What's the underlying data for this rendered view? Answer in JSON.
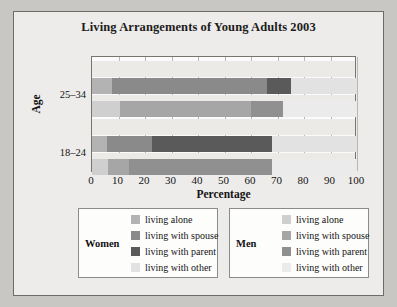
{
  "chart_data": {
    "type": "bar",
    "orientation": "horizontal",
    "stacked": true,
    "title": "Living Arrangements of Young Adults 2003",
    "xlabel": "Percentage",
    "ylabel": "Age",
    "xlim": [
      0,
      100
    ],
    "xticks": [
      0,
      10,
      20,
      30,
      40,
      50,
      60,
      70,
      80,
      90,
      100
    ],
    "categories": [
      "25–34",
      "18–24"
    ],
    "grid": true,
    "legend_position": "bottom",
    "segment_names": [
      "living alone",
      "living with spouse",
      "living with parent",
      "living with other"
    ],
    "bars": [
      {
        "age": "25–34",
        "group": "Women",
        "values": [
          7.5,
          58.5,
          9.0,
          25.0
        ],
        "cumulative": [
          7.5,
          66.0,
          75.0,
          100.0
        ]
      },
      {
        "age": "25–34",
        "group": "Men",
        "values": [
          10.5,
          49.5,
          12.0,
          28.0
        ],
        "cumulative": [
          10.5,
          60.0,
          72.0,
          100.0
        ]
      },
      {
        "age": "18–24",
        "group": "Women",
        "values": [
          5.5,
          17.0,
          45.5,
          32.0
        ],
        "cumulative": [
          5.5,
          22.5,
          68.0,
          100.0
        ]
      },
      {
        "age": "18–24",
        "group": "Men",
        "values": [
          6.0,
          8.0,
          54.0,
          32.0
        ],
        "cumulative": [
          6.0,
          14.0,
          68.0,
          100.0
        ]
      }
    ],
    "colors": {
      "women_alone": "#b3b3b3",
      "women_spouse": "#8a8a8a",
      "women_parent": "#5a5a5a",
      "women_other": "#e2e2e2",
      "men_alone": "#cfcfcf",
      "men_spouse": "#a6a6a6",
      "men_parent": "#909090",
      "men_other": "#ebebeb",
      "plot_background": "#fbfbfb",
      "band_background": "#eceae6",
      "figure_background": "#edeceb",
      "grid": "#b9b7b2"
    }
  },
  "axis": {
    "tick_labels": [
      "0",
      "10",
      "20",
      "30",
      "40",
      "50",
      "60",
      "70",
      "80",
      "90",
      "100"
    ],
    "x_title": "Percentage",
    "y_title": "Age",
    "y_categories": [
      "25–34",
      "18–24"
    ]
  },
  "legends": [
    {
      "heading": "Women",
      "rows": [
        {
          "label": "living alone",
          "color": "#b3b3b3"
        },
        {
          "label": "living with spouse",
          "color": "#8a8a8a"
        },
        {
          "label": "living with parent",
          "color": "#5a5a5a"
        },
        {
          "label": "living with other",
          "color": "#e2e2e2"
        }
      ]
    },
    {
      "heading": "Men",
      "rows": [
        {
          "label": "living alone",
          "color": "#cfcfcf"
        },
        {
          "label": "living with spouse",
          "color": "#a6a6a6"
        },
        {
          "label": "living with parent",
          "color": "#909090"
        },
        {
          "label": "living with other",
          "color": "#ebebeb"
        }
      ]
    }
  ]
}
